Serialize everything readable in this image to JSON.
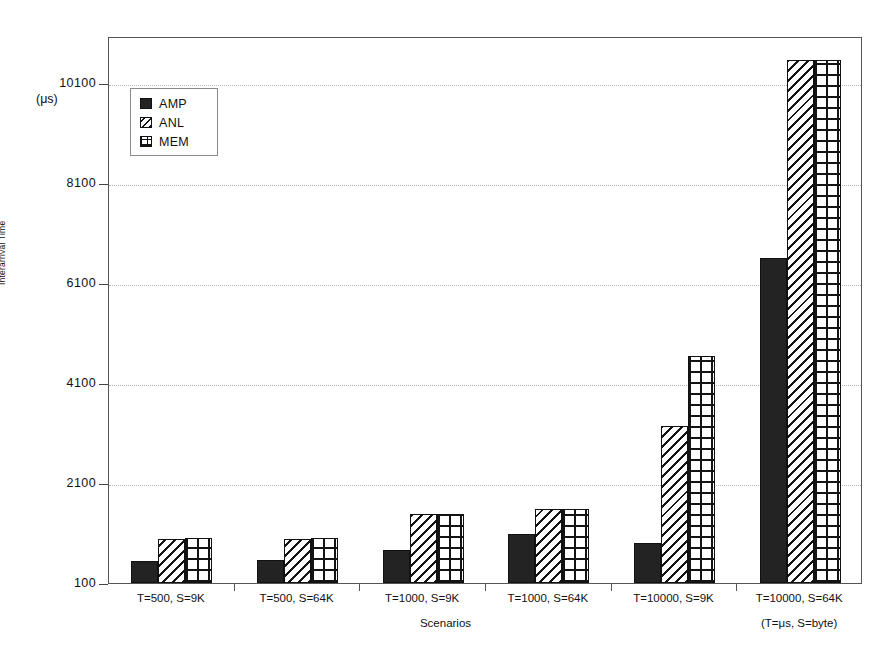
{
  "chart_data": {
    "type": "bar",
    "title": "",
    "xlabel": "Scenarios",
    "ylabel": "Interarrival Time",
    "yunit": "(μs)",
    "xnote": "(T=μs, S=byte)",
    "categories": [
      "T=500, S=9K",
      "T=500, S=64K",
      "T=1000, S=9K",
      "T=1000, S=64K",
      "T=10000, S=9K",
      "T=10000, S=64K"
    ],
    "series": [
      {
        "name": "AMP",
        "pattern": "solid",
        "values": [
          540,
          560,
          760,
          1080,
          900,
          6600
        ]
      },
      {
        "name": "ANL",
        "pattern": "diagonal-hatch",
        "values": [
          980,
          990,
          1480,
          1580,
          3240,
          10560
        ]
      },
      {
        "name": "MEM",
        "pattern": "grid-hatch",
        "values": [
          1000,
          1000,
          1490,
          1590,
          4640,
          10560
        ]
      }
    ],
    "ylim": [
      100,
      11100
    ],
    "yticks": [
      100,
      2100,
      4100,
      6100,
      8100,
      10100
    ],
    "yticklabels": [
      "100",
      "2100",
      "4100",
      "6100",
      "8100",
      "10100"
    ],
    "grid": true,
    "legend_position": "upper-left",
    "legend_entries": [
      "AMP",
      "ANL",
      "MEM"
    ]
  },
  "colors": {
    "bar_solid": "#232323",
    "bar_outline": "#111111",
    "gridline": "#b4b4b4",
    "axis": "#555555",
    "background": "#ffffff"
  }
}
